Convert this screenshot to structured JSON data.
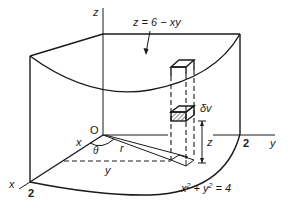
{
  "diagram": {
    "labels": {
      "z_axis": "z",
      "x_axis": "x",
      "y_axis": "y",
      "origin": "O",
      "surface": "z = 6 − xy",
      "volume_element": "δv",
      "height": "z",
      "x_coord": "x",
      "y_coord": "y",
      "theta": "θ",
      "radius": "r",
      "x_intercept": "2",
      "y_intercept": "2",
      "boundary_lhs": "x",
      "boundary_sup1": "2",
      "boundary_mid": " + y",
      "boundary_sup2": "2",
      "boundary_rhs": " = 4"
    },
    "colors": {
      "ink": "#1a1a1a",
      "background": "#ffffff"
    }
  }
}
